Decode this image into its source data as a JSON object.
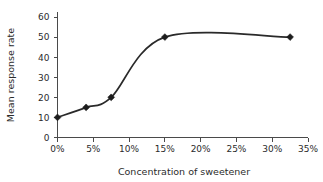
{
  "chart_data": {
    "type": "line",
    "title": "",
    "xlabel": "Concentration of sweetener",
    "ylabel": "Mean response rate",
    "xlim": [
      0,
      35
    ],
    "ylim": [
      0,
      60
    ],
    "grid": false,
    "legend": false,
    "marker": "diamond",
    "line_color": "#2a2a2a",
    "marker_color": "#1d1d1d",
    "axis_color": "#4a4a4a",
    "text_color": "#2b2b2b",
    "x_tick_labels": [
      "0%",
      "5%",
      "10%",
      "15%",
      "20%",
      "25%",
      "30%",
      "35%"
    ],
    "x_tick_values": [
      0,
      5,
      10,
      15,
      20,
      25,
      30,
      35
    ],
    "y_tick_labels": [
      "0",
      "10",
      "20",
      "30",
      "40",
      "50",
      "60"
    ],
    "y_tick_values": [
      0,
      10,
      20,
      30,
      40,
      50,
      60
    ],
    "x": [
      0,
      4,
      7.5,
      15,
      32.5
    ],
    "values": [
      10,
      15,
      20,
      50,
      50
    ],
    "points": [
      {
        "x": 0,
        "y": 10
      },
      {
        "x": 4,
        "y": 15
      },
      {
        "x": 7.5,
        "y": 20
      },
      {
        "x": 15,
        "y": 50
      },
      {
        "x": 32.5,
        "y": 50
      }
    ]
  }
}
